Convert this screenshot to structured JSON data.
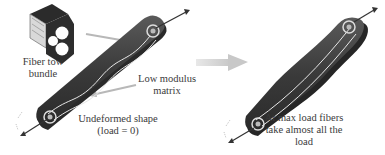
{
  "figure": {
    "labels": {
      "fiber_tow": [
        "Fiber tow",
        "bundle"
      ],
      "matrix": [
        "Low modulus",
        "matrix"
      ],
      "undeformed": [
        "Undeformed shape",
        "(load = 0)"
      ],
      "max_load": [
        "At max load fibers",
        "take almost all the",
        "load"
      ]
    },
    "colors": {
      "body": "#3d3d3d",
      "fiber": "#e6e6e6",
      "pointer": "#b8b8b8",
      "big_arrow": "#d2d2d2",
      "text": "#3a3a3a"
    },
    "shapes": {
      "undeformed": "straight link with wavy fiber loop",
      "loaded": "necked link with straightened fibers"
    }
  }
}
